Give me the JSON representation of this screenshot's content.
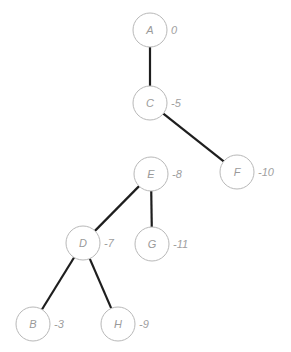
{
  "diagram": {
    "type": "tree",
    "nodes": [
      {
        "id": "A",
        "label": "A",
        "value": "0",
        "x": 150,
        "y": 30
      },
      {
        "id": "C",
        "label": "C",
        "value": "-5",
        "x": 150,
        "y": 103
      },
      {
        "id": "F",
        "label": "F",
        "value": "-10",
        "x": 237,
        "y": 172
      },
      {
        "id": "E",
        "label": "E",
        "value": "-8",
        "x": 151,
        "y": 174
      },
      {
        "id": "D",
        "label": "D",
        "value": "-7",
        "x": 83,
        "y": 243
      },
      {
        "id": "G",
        "label": "G",
        "value": "-11",
        "x": 152,
        "y": 244
      },
      {
        "id": "B",
        "label": "B",
        "value": "-3",
        "x": 33,
        "y": 324
      },
      {
        "id": "H",
        "label": "H",
        "value": "-9",
        "x": 118,
        "y": 324
      }
    ],
    "edges": [
      {
        "from": "A",
        "to": "C"
      },
      {
        "from": "C",
        "to": "F"
      },
      {
        "from": "E",
        "to": "D"
      },
      {
        "from": "E",
        "to": "G"
      },
      {
        "from": "D",
        "to": "B"
      },
      {
        "from": "D",
        "to": "H"
      }
    ],
    "node_radius": 17,
    "colors": {
      "edge": "#1e1e1e",
      "node_stroke": "#b8b8b8",
      "text": "#9a9a9a"
    }
  }
}
